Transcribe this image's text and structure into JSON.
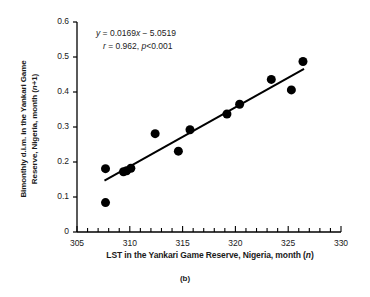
{
  "figure": {
    "caption": "(b)",
    "annotation": {
      "equation_prefix": "y",
      "equation_body": " = 0.0169",
      "equation_var": "x",
      "equation_suffix": " − 5.0519",
      "stat_r_symbol": "r",
      "stat_r_value": " = 0.962, ",
      "stat_p_symbol": "p",
      "stat_p_value": "<0.001"
    }
  },
  "chart_data": {
    "type": "scatter",
    "title": "",
    "xlabel": "LST in the Yankari Game Reserve, Nigeria, month (n)",
    "xlabel_parts": {
      "main": "LST in the Yankari Game  Reserve, Nigeria, month (",
      "italic": "n",
      "tail": ")"
    },
    "ylabel": "Bimonthly d.i.m. in the Yankari Game Reserve, Nigeria, month (n+1)",
    "ylabel_parts": {
      "line1": "Bimonthly d.i.m. in the Yankari Game",
      "line2_main": "Reserve, Nigeria, month (",
      "line2_italic": "n",
      "line2_tail": "+1)"
    },
    "xlim": [
      305,
      330
    ],
    "ylim": [
      0,
      0.6
    ],
    "xticks": [
      305,
      310,
      315,
      320,
      325,
      330
    ],
    "xtick_labels": [
      "305",
      "310",
      "315",
      "320",
      "325",
      "330"
    ],
    "x_minor_tick_step": 1,
    "yticks": [
      0,
      0.1,
      0.2,
      0.3,
      0.4,
      0.5,
      0.6
    ],
    "ytick_labels": [
      "0",
      "0.1",
      "0.2",
      "0.3",
      "0.4",
      "0.5",
      "0.6"
    ],
    "grid": false,
    "legend": "none",
    "marker": {
      "shape": "circle",
      "color": "#000000",
      "size_px": 9
    },
    "points": [
      {
        "x": 307.7,
        "y": 0.181
      },
      {
        "x": 307.7,
        "y": 0.084
      },
      {
        "x": 309.4,
        "y": 0.172
      },
      {
        "x": 309.7,
        "y": 0.175
      },
      {
        "x": 310.1,
        "y": 0.182
      },
      {
        "x": 312.4,
        "y": 0.281
      },
      {
        "x": 314.6,
        "y": 0.231
      },
      {
        "x": 315.7,
        "y": 0.292
      },
      {
        "x": 319.2,
        "y": 0.337
      },
      {
        "x": 320.4,
        "y": 0.365
      },
      {
        "x": 323.4,
        "y": 0.436
      },
      {
        "x": 325.3,
        "y": 0.406
      },
      {
        "x": 326.4,
        "y": 0.487
      }
    ],
    "fit_line": {
      "slope": 0.0169,
      "intercept": -5.0519,
      "x_start": 307.6,
      "x_end": 326.5,
      "color": "#000000",
      "width_px": 2
    },
    "statistics": {
      "r": 0.962,
      "p": "<0.001"
    }
  }
}
